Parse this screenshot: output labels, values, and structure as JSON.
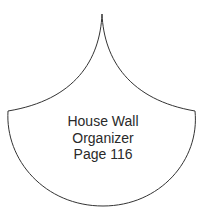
{
  "template": {
    "shape": "scallop-onion-dome",
    "stroke_color": "#333333",
    "fill_color": "#ffffff",
    "label_lines": [
      "House Wall",
      "Organizer",
      "Page 116"
    ]
  }
}
